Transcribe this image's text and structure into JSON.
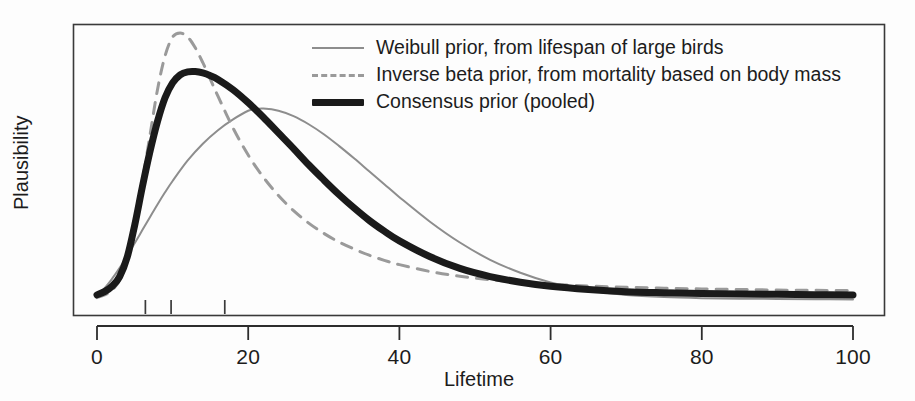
{
  "chart_data": {
    "type": "line",
    "title": "",
    "xlabel": "Lifetime",
    "ylabel": "Plausibility",
    "xlim": [
      0,
      103
    ],
    "ylim": [
      0,
      1.07
    ],
    "grid": false,
    "legend_position": "top-center",
    "xticks": [
      0,
      20,
      40,
      60,
      80,
      100
    ],
    "xtick_labels": [
      "0",
      "20",
      "40",
      "60",
      "80",
      "100"
    ],
    "yticks": [],
    "ytick_labels": [],
    "rug_marks": [
      6.4,
      9.8,
      16.9
    ],
    "series": [
      {
        "name": "Weibull prior, from lifespan of large birds",
        "style": "solid-thin",
        "color": "#8d8d8d",
        "width": 2,
        "peak_x": 21,
        "peak_y": 0.72,
        "x": [
          0,
          1,
          2,
          3,
          4,
          5,
          6,
          7,
          8,
          9,
          10,
          12,
          14,
          16,
          18,
          20,
          21,
          22,
          24,
          26,
          28,
          30,
          32,
          34,
          36,
          38,
          40,
          44,
          48,
          52,
          56,
          60,
          65,
          70,
          75,
          80,
          85,
          90,
          95,
          100
        ],
        "y": [
          0.03,
          0.055,
          0.09,
          0.13,
          0.175,
          0.222,
          0.27,
          0.318,
          0.365,
          0.41,
          0.452,
          0.528,
          0.59,
          0.64,
          0.68,
          0.712,
          0.718,
          0.72,
          0.712,
          0.692,
          0.662,
          0.625,
          0.582,
          0.536,
          0.488,
          0.44,
          0.392,
          0.302,
          0.224,
          0.16,
          0.112,
          0.076,
          0.046,
          0.03,
          0.022,
          0.018,
          0.016,
          0.015,
          0.014,
          0.013
        ]
      },
      {
        "name": "Inverse beta prior, from mortality based on body mass",
        "style": "dashed",
        "color": "#9a9a9a",
        "width": 3,
        "peak_x": 11,
        "peak_y": 1.0,
        "x": [
          0,
          1,
          2,
          3,
          4,
          5,
          6,
          7,
          8,
          9,
          10,
          11,
          12,
          13,
          14,
          15,
          16,
          18,
          20,
          22,
          24,
          26,
          28,
          30,
          32,
          34,
          36,
          38,
          40,
          44,
          48,
          52,
          56,
          60,
          65,
          70,
          75,
          80,
          85,
          90,
          95,
          100
        ],
        "y": [
          0.02,
          0.03,
          0.048,
          0.085,
          0.16,
          0.29,
          0.45,
          0.62,
          0.79,
          0.915,
          0.985,
          1.0,
          0.985,
          0.945,
          0.89,
          0.828,
          0.766,
          0.648,
          0.548,
          0.466,
          0.398,
          0.342,
          0.296,
          0.258,
          0.226,
          0.2,
          0.177,
          0.158,
          0.142,
          0.117,
          0.099,
          0.086,
          0.077,
          0.07,
          0.063,
          0.058,
          0.055,
          0.052,
          0.05,
          0.048,
          0.047,
          0.046
        ]
      },
      {
        "name": "Consensus prior (pooled)",
        "style": "solid-thick",
        "color": "#1a1a1a",
        "width": 7,
        "peak_x": 13.5,
        "peak_y": 0.855,
        "x": [
          0,
          1,
          2,
          3,
          4,
          5,
          6,
          7,
          8,
          9,
          10,
          11,
          12,
          13,
          14,
          15,
          16,
          18,
          20,
          22,
          24,
          26,
          28,
          30,
          32,
          34,
          36,
          38,
          40,
          44,
          48,
          52,
          56,
          60,
          65,
          70,
          75,
          80,
          85,
          90,
          95,
          100
        ],
        "y": [
          0.03,
          0.042,
          0.062,
          0.098,
          0.17,
          0.29,
          0.43,
          0.56,
          0.672,
          0.76,
          0.815,
          0.845,
          0.856,
          0.857,
          0.852,
          0.842,
          0.828,
          0.79,
          0.742,
          0.688,
          0.63,
          0.572,
          0.512,
          0.456,
          0.402,
          0.352,
          0.306,
          0.266,
          0.23,
          0.172,
          0.128,
          0.098,
          0.077,
          0.062,
          0.05,
          0.042,
          0.038,
          0.035,
          0.033,
          0.032,
          0.031,
          0.03
        ]
      }
    ]
  },
  "legend": {
    "items": [
      {
        "label": "Weibull prior, from lifespan of large birds",
        "style": "solid-thin"
      },
      {
        "label": "Inverse beta prior, from mortality based on body mass",
        "style": "dashed"
      },
      {
        "label": "Consensus prior (pooled)",
        "style": "solid-thick"
      }
    ]
  },
  "axes": {
    "x_title": "Lifetime",
    "y_title": "Plausibility",
    "x_tick_labels": [
      "0",
      "20",
      "40",
      "60",
      "80",
      "100"
    ]
  }
}
